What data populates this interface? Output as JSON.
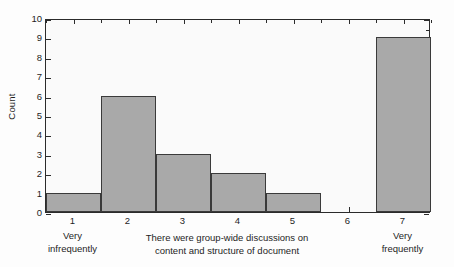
{
  "chart_data": {
    "type": "bar",
    "title": "",
    "subtitle": "",
    "xlabel_lines": [
      "There were group-wide discussions on",
      "content and structure of document"
    ],
    "ylabel": "Count",
    "categories": [
      "1",
      "2",
      "3",
      "4",
      "5",
      "6",
      "7"
    ],
    "values": [
      1,
      6,
      3,
      2,
      1,
      0,
      9
    ],
    "series": [
      {
        "name": "Count",
        "values": [
          1,
          6,
          3,
          2,
          1,
          0,
          9
        ]
      }
    ],
    "ylim": [
      0,
      10
    ],
    "xlim": [
      0.5,
      7.5
    ],
    "y_ticks": [
      0,
      1,
      2,
      3,
      4,
      5,
      6,
      7,
      8,
      9,
      10
    ],
    "y_tick_labels": [
      "0",
      "1",
      "2",
      "3",
      "4",
      "5",
      "6",
      "7",
      "8",
      "9",
      "10"
    ],
    "x_ticks": [
      1,
      2,
      3,
      4,
      5,
      6,
      7
    ],
    "x_tick_labels": [
      "1",
      "2",
      "3",
      "4",
      "5",
      "6",
      "7"
    ],
    "scale_anchors": [
      {
        "at": "1",
        "lines": [
          "Very",
          "infrequently"
        ]
      },
      {
        "at": "7",
        "lines": [
          "Very",
          "frequently"
        ]
      }
    ],
    "grid": false,
    "legend": false,
    "legend_position": "none",
    "bar_fill_color": "#a9a9a9",
    "bar_edge_color": "#3a3a3a",
    "axis_color": "#2b2b2b",
    "plot_background_color": "#fafafa",
    "figure_background_color": "#fdfdfd",
    "text_color": "#1d1d1d"
  }
}
